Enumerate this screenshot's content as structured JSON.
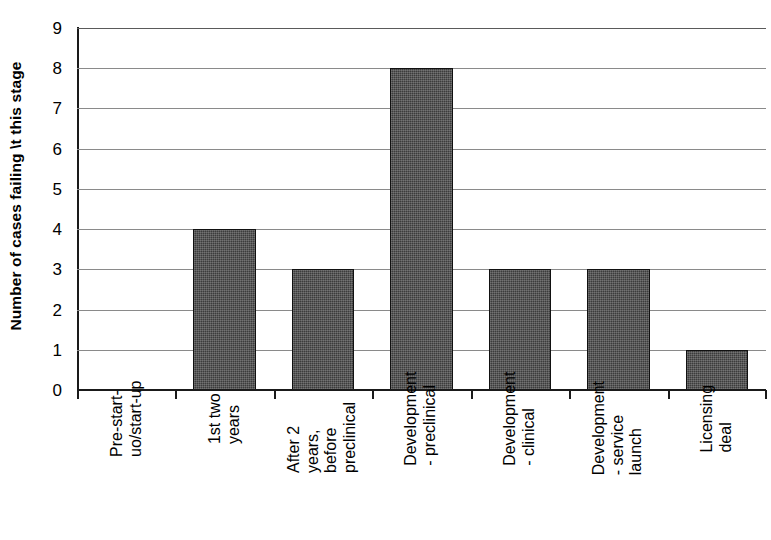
{
  "chart_data": {
    "type": "bar",
    "title": "",
    "subtitle": "",
    "xlabel": "",
    "ylabel": "Number of cases failing \\t this stage",
    "ylim": [
      0,
      9
    ],
    "ytick_values": [
      0,
      1,
      2,
      3,
      4,
      5,
      6,
      7,
      8,
      9
    ],
    "ytick_labels": [
      "0",
      "1",
      "2",
      "3",
      "4",
      "5",
      "6",
      "7",
      "8",
      "9"
    ],
    "grid": true,
    "grid_axis": "y",
    "legend": false,
    "legend_position": "none",
    "bar_fill_color": "#3c3c3c",
    "bar_edge_color": "#111111",
    "gridline_color": "#8a8a8a",
    "axis_color": "#1a1a1a",
    "background_color": "#ffffff",
    "categories": [
      "Pre-start-uo/start-up",
      "1st two years",
      "After 2 years, before preclinical",
      "Development - preclinical",
      "Development - clinical",
      "Development - service launch",
      "Licensing deal"
    ],
    "category_label_lines": [
      [
        "Pre-start-",
        "uo/start-up"
      ],
      [
        "1st two",
        "years"
      ],
      [
        "After 2",
        "years,",
        "before",
        "preclinical"
      ],
      [
        "Development",
        "- preclinical"
      ],
      [
        "Development",
        "- clinical"
      ],
      [
        "Development",
        "- service",
        "launch"
      ],
      [
        "Licensing",
        "deal"
      ]
    ],
    "values": [
      0,
      4,
      3,
      8,
      3,
      3,
      1
    ],
    "annotations": []
  }
}
